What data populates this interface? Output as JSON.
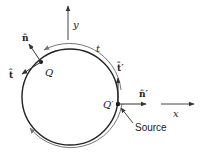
{
  "diagram": {
    "labels": {
      "y_axis": "y",
      "x_axis": "x",
      "n_hat": "n̂",
      "t_hat": "t̂",
      "Q": "Q",
      "t": "t",
      "t_hat_prime": "t̂′",
      "n_hat_prime": "n̂′",
      "Q_prime": "Q′",
      "source": "Source"
    },
    "colors": {
      "stroke": "#222222",
      "arc_gray": "#777777"
    }
  }
}
